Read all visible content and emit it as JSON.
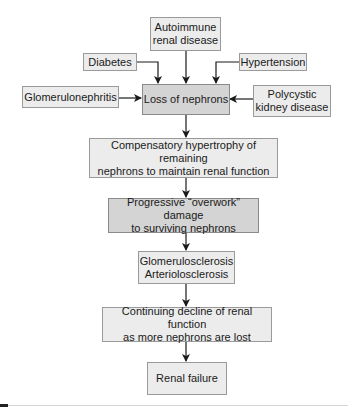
{
  "diagram": {
    "causes": {
      "autoimmune": "Autoimmune\nrenal disease",
      "diabetes": "Diabetes",
      "hypertension": "Hypertension",
      "glomerulonephritis": "Glomerulonephritis",
      "polycystic": "Polycystic\nkidney disease"
    },
    "steps": {
      "loss": "Loss of nephrons",
      "compensatory": "Compensatory hypertrophy of remaining\nnephrons to maintain renal function",
      "progressive": "Progressive “overwork” damage\nto surviving nephrons",
      "sclerosis": "Glomerulosclerosis\nArteriolosclerosis",
      "decline": "Continuing decline of renal function\nas more nephrons are lost",
      "failure": "Renal failure"
    },
    "colors": {
      "box_fill": "#ececec",
      "box_fill_emphasis": "#d4d4d4",
      "box_border": "#9a9a9a",
      "arrow": "#1a1a1a"
    }
  }
}
